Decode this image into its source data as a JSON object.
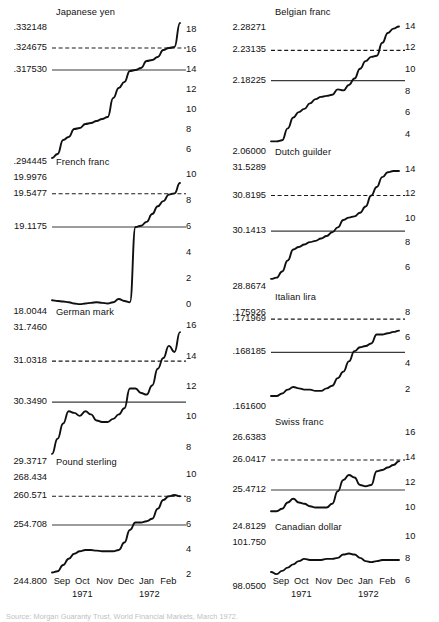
{
  "figure": {
    "source_note": "Source: Morgan Guaranty Trust, World Financial Markets, March 1972."
  },
  "axis": {
    "months": [
      "Sep",
      "Oct",
      "Nov",
      "Dec",
      "Jan",
      "Feb"
    ],
    "year_left": "1971",
    "year_right": "1972"
  },
  "chart_data": {
    "type": "line",
    "xlabel": "",
    "ylabel": "",
    "grid": false,
    "legend": "none",
    "x": [
      "Sep 1971",
      "Oct 1971",
      "Nov 1971",
      "Dec 1971",
      "Jan 1972",
      "Feb 1972"
    ],
    "panels": [
      {
        "name": "Japanese yen",
        "position": "left-column-1",
        "left_ticks": [
          ".332148",
          ".324675",
          ".317530",
          ".294445"
        ],
        "left_tick_roles": [
          "top",
          "dashed-upper-limit",
          "solid-parity",
          "bottom"
        ],
        "right_ticks": [
          "18",
          "16",
          "14",
          "12",
          "10",
          "8",
          "6"
        ],
        "right_axis_label": "percent",
        "ylim_percent": [
          5,
          19
        ],
        "parity_percent": 14.0,
        "upper_limit_percent": 16.2,
        "values_percent": [
          5.2,
          5.6,
          7.0,
          7.3,
          8.1,
          8.2,
          8.6,
          8.7,
          8.9,
          9.1,
          9.3,
          11.2,
          12.2,
          12.8,
          13.9,
          14.0,
          14.2,
          14.9,
          15.0,
          15.3,
          16.0,
          16.2,
          16.3,
          18.7
        ]
      },
      {
        "name": "French franc",
        "position": "left-column-2",
        "left_ticks": [
          "19.9976",
          "19.5477",
          "19.1175",
          "18.0044"
        ],
        "left_tick_roles": [
          "top",
          "dashed-upper-limit",
          "solid-parity",
          "bottom"
        ],
        "right_ticks": [
          "10",
          "8",
          "6",
          "4",
          "2",
          "0"
        ],
        "right_axis_label": "percent",
        "ylim_percent": [
          -0.4,
          10.4
        ],
        "parity_percent": 6.0,
        "upper_limit_percent": 8.57,
        "values_percent": [
          0.35,
          0.3,
          0.25,
          0.2,
          0.1,
          0.05,
          0.1,
          0.15,
          0.2,
          0.15,
          0.1,
          0.2,
          0.45,
          0.3,
          0.2,
          6.0,
          6.1,
          6.4,
          7.0,
          7.6,
          8.0,
          8.5,
          8.6,
          9.4
        ]
      },
      {
        "name": "German mark",
        "position": "left-column-3",
        "left_ticks": [
          "31.7460",
          "31.0318",
          "30.3490",
          "29.3717"
        ],
        "left_tick_roles": [
          "top",
          "dashed-upper-limit",
          "solid-parity",
          "bottom"
        ],
        "right_ticks": [
          "16",
          "14",
          "12",
          "10",
          "8"
        ],
        "right_axis_label": "percent",
        "ylim_percent": [
          7.2,
          16.4
        ],
        "parity_percent": 11.0,
        "upper_limit_percent": 13.7,
        "values_percent": [
          7.6,
          8.6,
          9.6,
          10.4,
          10.3,
          10.1,
          10.4,
          10.2,
          9.8,
          9.7,
          9.7,
          9.9,
          10.2,
          10.6,
          11.9,
          11.9,
          11.6,
          11.5,
          12.1,
          13.2,
          13.9,
          14.7,
          14.3,
          15.6
        ]
      },
      {
        "name": "Pound sterling",
        "position": "left-column-4",
        "left_ticks": [
          "268.434",
          "260.571",
          "254.708",
          "244.800"
        ],
        "left_tick_roles": [
          "top",
          "dashed-upper-limit",
          "solid-parity",
          "bottom"
        ],
        "right_ticks": [
          "10",
          "8",
          "6",
          "4",
          "2"
        ],
        "right_axis_label": "percent",
        "ylim_percent": [
          1.6,
          10.4
        ],
        "parity_percent": 6.0,
        "upper_limit_percent": 8.3,
        "values_percent": [
          2.2,
          2.3,
          2.8,
          3.3,
          3.7,
          3.9,
          4.0,
          4.0,
          3.95,
          3.9,
          3.9,
          3.9,
          4.0,
          4.6,
          5.6,
          6.2,
          6.2,
          6.3,
          6.5,
          7.3,
          8.0,
          8.3,
          8.4,
          8.3
        ]
      },
      {
        "name": "Belgian franc",
        "position": "right-column-1",
        "left_ticks": [
          "2.28271",
          "2.23135",
          "2.18225",
          "2.06000"
        ],
        "left_tick_roles": [
          "top",
          "dashed-upper-limit",
          "solid-parity",
          "bottom"
        ],
        "right_ticks": [
          "14",
          "12",
          "10",
          "8",
          "6",
          "4"
        ],
        "right_axis_label": "percent",
        "ylim_percent": [
          2.6,
          14.6
        ],
        "parity_percent": 9.0,
        "upper_limit_percent": 11.8,
        "values_percent": [
          3.4,
          3.4,
          3.5,
          4.6,
          5.6,
          6.1,
          6.4,
          6.9,
          7.3,
          7.5,
          7.6,
          7.7,
          8.2,
          8.1,
          8.6,
          9.2,
          10.1,
          10.8,
          11.2,
          11.3,
          12.5,
          13.4,
          13.8,
          14.0
        ]
      },
      {
        "name": "Dutch guilder",
        "position": "right-column-2",
        "left_ticks": [
          "31.5289",
          "30.8195",
          "30.1413",
          "28.8674"
        ],
        "left_tick_roles": [
          "top",
          "dashed-upper-limit",
          "solid-parity",
          "bottom"
        ],
        "right_ticks": [
          "14",
          "12",
          "10",
          "8",
          "6"
        ],
        "right_axis_label": "percent",
        "ylim_percent": [
          4.6,
          14.8
        ],
        "parity_percent": 9.0,
        "upper_limit_percent": 11.9,
        "values_percent": [
          5.1,
          5.2,
          5.7,
          6.6,
          7.5,
          7.7,
          7.9,
          8.1,
          8.2,
          8.4,
          8.6,
          8.9,
          9.3,
          9.9,
          10.1,
          10.2,
          10.5,
          11.0,
          11.9,
          12.6,
          13.4,
          13.8,
          13.9,
          13.9
        ]
      },
      {
        "name": "Italian lira",
        "position": "right-column-3",
        "left_ticks": [
          ".175926",
          ".171969",
          ".168185",
          ".161600"
        ],
        "left_tick_roles": [
          "top",
          "dashed-upper-limit",
          "solid-parity",
          "bottom"
        ],
        "right_ticks": [
          "8",
          "6",
          "4",
          "2"
        ],
        "right_axis_label": "percent",
        "ylim_percent": [
          0.8,
          8.6
        ],
        "parity_percent": 4.9,
        "upper_limit_percent": 7.5,
        "values_percent": [
          1.5,
          1.5,
          1.7,
          2.0,
          2.2,
          2.1,
          2.0,
          2.0,
          1.9,
          1.9,
          2.1,
          2.3,
          2.9,
          3.4,
          4.2,
          5.0,
          5.3,
          5.4,
          5.6,
          6.3,
          6.3,
          6.4,
          6.5,
          6.6
        ]
      },
      {
        "name": "Swiss franc",
        "position": "right-column-4",
        "left_ticks": [
          "26.6383",
          "26.0417",
          "25.4712",
          "24.8129"
        ],
        "left_tick_roles": [
          "top",
          "dashed-upper-limit",
          "solid-parity",
          "bottom"
        ],
        "right_ticks": [
          "16",
          "14",
          "12",
          "10"
        ],
        "right_axis_label": "percent",
        "ylim_percent": [
          8.6,
          16.2
        ],
        "parity_percent": 11.4,
        "upper_limit_percent": 13.8,
        "values_percent": [
          9.7,
          9.7,
          9.9,
          10.4,
          10.7,
          10.4,
          10.3,
          10.1,
          10.0,
          10.0,
          10.0,
          10.3,
          11.3,
          12.2,
          12.6,
          12.4,
          11.8,
          11.7,
          11.8,
          12.9,
          13.0,
          13.2,
          13.4,
          13.7
        ]
      },
      {
        "name": "Canadian dollar",
        "position": "right-column-5",
        "left_ticks": [
          "101.750",
          "98.0500"
        ],
        "left_tick_roles": [
          "top",
          "bottom"
        ],
        "right_ticks": [
          "10",
          "8",
          "6"
        ],
        "right_axis_label": "percent",
        "ylim_percent": [
          5.6,
          10.2
        ],
        "parity_percent": null,
        "upper_limit_percent": null,
        "values_percent": [
          6.8,
          6.6,
          6.9,
          7.2,
          7.5,
          7.8,
          8.0,
          7.9,
          7.9,
          7.9,
          8.0,
          8.0,
          8.1,
          8.4,
          8.5,
          8.4,
          8.1,
          7.8,
          7.7,
          7.8,
          7.9,
          7.9,
          7.9,
          7.9
        ]
      }
    ]
  }
}
